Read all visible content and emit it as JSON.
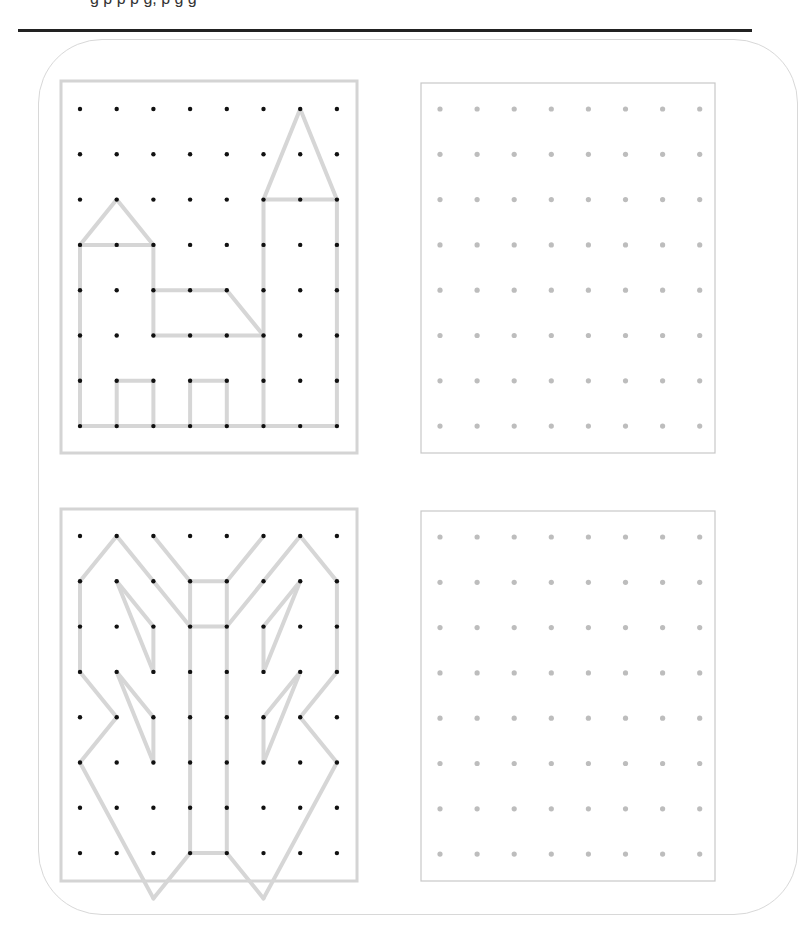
{
  "header": {
    "partial_text": "g       p    p    p     g,                                    p    g      g"
  },
  "colors": {
    "rule": "#222222",
    "card_border": "#d8d8d8",
    "frame_model": "#d4d4d4",
    "frame_blank": "#c8c8c8",
    "line": "#d6d6d6",
    "dot_model": "#111111",
    "dot_blank": "#bdbdbd"
  },
  "grids": [
    {
      "name": "castle-model",
      "frame": [
        61,
        81,
        296,
        372
      ],
      "origin": [
        80,
        109
      ],
      "dx": 36.7,
      "dy": 45.3,
      "cols": 8,
      "rows": 8,
      "dot": "model",
      "segments": [
        [
          [
            0,
            3
          ],
          [
            0,
            7
          ]
        ],
        [
          [
            0,
            3
          ],
          [
            2,
            3
          ]
        ],
        [
          [
            0,
            3
          ],
          [
            1,
            2
          ]
        ],
        [
          [
            1,
            2
          ],
          [
            2,
            3
          ]
        ],
        [
          [
            2,
            3
          ],
          [
            2,
            5
          ]
        ],
        [
          [
            2,
            4
          ],
          [
            4,
            4
          ]
        ],
        [
          [
            4,
            4
          ],
          [
            5,
            5
          ]
        ],
        [
          [
            2,
            5
          ],
          [
            5,
            5
          ]
        ],
        [
          [
            0,
            7
          ],
          [
            7,
            7
          ]
        ],
        [
          [
            1,
            7
          ],
          [
            1,
            6
          ]
        ],
        [
          [
            1,
            6
          ],
          [
            2,
            6
          ]
        ],
        [
          [
            2,
            6
          ],
          [
            2,
            7
          ]
        ],
        [
          [
            3,
            7
          ],
          [
            3,
            6
          ]
        ],
        [
          [
            3,
            6
          ],
          [
            4,
            6
          ]
        ],
        [
          [
            4,
            6
          ],
          [
            4,
            7
          ]
        ],
        [
          [
            5,
            2
          ],
          [
            5,
            7
          ]
        ],
        [
          [
            5,
            2
          ],
          [
            7,
            2
          ]
        ],
        [
          [
            7,
            2
          ],
          [
            7,
            7
          ]
        ],
        [
          [
            5,
            2
          ],
          [
            6,
            0
          ]
        ],
        [
          [
            6,
            0
          ],
          [
            7,
            2
          ]
        ]
      ]
    },
    {
      "name": "castle-blank",
      "frame": [
        421,
        83,
        294,
        370
      ],
      "origin": [
        440,
        109
      ],
      "dx": 37.1,
      "dy": 45.3,
      "cols": 8,
      "rows": 8,
      "dot": "blank",
      "segments": []
    },
    {
      "name": "butterfly-model",
      "frame": [
        61,
        509,
        296,
        372
      ],
      "origin": [
        80,
        536
      ],
      "dx": 36.7,
      "dy": 45.3,
      "cols": 8,
      "rows": 8,
      "dot": "model",
      "segments": [
        [
          [
            0,
            1
          ],
          [
            1,
            0
          ]
        ],
        [
          [
            1,
            0
          ],
          [
            3,
            2
          ]
        ],
        [
          [
            2,
            0
          ],
          [
            3,
            1
          ]
        ],
        [
          [
            3,
            1
          ],
          [
            4,
            1
          ]
        ],
        [
          [
            4,
            1
          ],
          [
            5,
            0
          ]
        ],
        [
          [
            4,
            2
          ],
          [
            6,
            0
          ]
        ],
        [
          [
            6,
            0
          ],
          [
            7,
            1
          ]
        ],
        [
          [
            3,
            1
          ],
          [
            3,
            7
          ]
        ],
        [
          [
            4,
            1
          ],
          [
            4,
            7
          ]
        ],
        [
          [
            3,
            2
          ],
          [
            4,
            2
          ]
        ],
        [
          [
            3,
            7
          ],
          [
            4,
            7
          ]
        ],
        [
          [
            0,
            1
          ],
          [
            0,
            3
          ]
        ],
        [
          [
            0,
            3
          ],
          [
            1,
            4
          ]
        ],
        [
          [
            1,
            4
          ],
          [
            0,
            5
          ]
        ],
        [
          [
            0,
            5
          ],
          [
            2,
            8
          ]
        ],
        [
          [
            2,
            8
          ],
          [
            3,
            7
          ]
        ],
        [
          [
            7,
            1
          ],
          [
            7,
            3
          ]
        ],
        [
          [
            7,
            3
          ],
          [
            6,
            4
          ]
        ],
        [
          [
            6,
            4
          ],
          [
            7,
            5
          ]
        ],
        [
          [
            7,
            5
          ],
          [
            5,
            8
          ]
        ],
        [
          [
            5,
            8
          ],
          [
            4,
            7
          ]
        ],
        [
          [
            1,
            1
          ],
          [
            2,
            2
          ]
        ],
        [
          [
            2,
            2
          ],
          [
            2,
            3
          ]
        ],
        [
          [
            2,
            3
          ],
          [
            1,
            1
          ]
        ],
        [
          [
            1,
            3
          ],
          [
            2,
            4
          ]
        ],
        [
          [
            2,
            4
          ],
          [
            2,
            5
          ]
        ],
        [
          [
            2,
            5
          ],
          [
            1,
            3
          ]
        ],
        [
          [
            6,
            1
          ],
          [
            5,
            2
          ]
        ],
        [
          [
            5,
            2
          ],
          [
            5,
            3
          ]
        ],
        [
          [
            5,
            3
          ],
          [
            6,
            1
          ]
        ],
        [
          [
            6,
            3
          ],
          [
            5,
            4
          ]
        ],
        [
          [
            5,
            4
          ],
          [
            5,
            5
          ]
        ],
        [
          [
            5,
            5
          ],
          [
            6,
            3
          ]
        ]
      ]
    },
    {
      "name": "butterfly-blank",
      "frame": [
        421,
        511,
        294,
        370
      ],
      "origin": [
        440,
        537
      ],
      "dx": 37.1,
      "dy": 45.3,
      "cols": 8,
      "rows": 8,
      "dot": "blank",
      "segments": []
    }
  ]
}
